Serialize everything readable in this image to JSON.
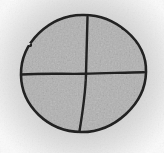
{
  "canvas": {
    "width": 164,
    "height": 153,
    "background_color": "#fbfbfb"
  },
  "halo": {
    "center_x": 83,
    "center_y": 74,
    "radius": 102,
    "inner_color": "#d4d4d4",
    "mid_color": "#e0e0e0",
    "soft_color": "#eeeeee",
    "outer_color": "#fafafa"
  },
  "circle": {
    "fill_color": "#b1b1b1",
    "outline_color": "#212121",
    "outline_width": 2.6,
    "outline_path": "M 82 15 C 114 14, 147 40, 146 72 C 145.5 104, 114 132.5, 81 132 C 48 131.5, 21.5 106, 21 75 C 20.5 43, 49 15.5, 82 15 Z"
  },
  "dividers": {
    "color": "#212121",
    "width": 2.4,
    "vertical_path": "M 87.5 17 C 87 36, 86.5 55, 86 74 C 85.5 93, 82.5 113, 79.5 131",
    "horizontal_path": "M 21.5 74.5 C 45 73, 65 74.2, 84 73.8 C 108 73.4, 128 72.2, 144 72.2"
  },
  "quadrant_count": 4
}
